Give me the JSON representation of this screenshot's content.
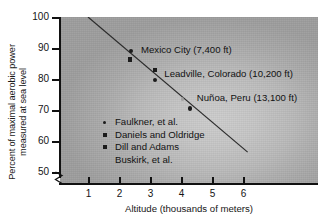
{
  "chart_data": {
    "type": "scatter",
    "title": "",
    "xlabel": "Altitude (thousands of meters)",
    "ylabel_line1": "Percent of maximal aerobic power",
    "ylabel_line2": "measured at sea level",
    "xlim": [
      0.3,
      6.95
    ],
    "ylim": [
      47.5,
      101
    ],
    "xticks": [
      1,
      2,
      3,
      4,
      5,
      6
    ],
    "yticks": [
      50,
      60,
      70,
      80,
      90,
      100
    ],
    "xtick_labels": [
      "1",
      "2",
      "3",
      "4",
      "5",
      "6"
    ],
    "ytick_labels": [
      "50",
      "60",
      "70",
      "80",
      "90",
      "100"
    ],
    "grid": false,
    "y_axis_break": true,
    "legend_position": "inside-lower-left",
    "series": [
      {
        "name": "Faulkner, et al.",
        "marker": "circle",
        "points": [
          {
            "x": 2.4,
            "y": 89.0
          },
          {
            "x": 3.15,
            "y": 79.8
          },
          {
            "x": 4.3,
            "y": 70.5
          }
        ]
      },
      {
        "name": "Daniels and Oldridge",
        "marker": "square",
        "points": [
          {
            "x": 2.35,
            "y": 86.3
          }
        ]
      },
      {
        "name": "Dill and Adams",
        "marker": "square",
        "points": [
          {
            "x": 3.15,
            "y": 83.0
          }
        ]
      },
      {
        "name": "Buskirk, et al.",
        "marker": "none",
        "points": [
          {
            "x": 4.05,
            "y": 73.5
          }
        ]
      }
    ],
    "trendline": {
      "x_start": 1.0,
      "y_start": 100.0,
      "x_end": 6.15,
      "y_end": 56.4
    },
    "annotations": [
      {
        "text": "Mexico City (7,400 ft)",
        "x": 2.55,
        "y": 89.5
      },
      {
        "text": "Leadville, Colorado (10,200 ft)",
        "x": 3.3,
        "y": 81.5
      },
      {
        "text": "Nuñoa, Peru (13,100 ft)",
        "x": 4.35,
        "y": 74.0
      }
    ]
  },
  "legend": {
    "items": [
      {
        "label": "Faulkner, et al.",
        "marker": "circle"
      },
      {
        "label": "Daniels and Oldridge",
        "marker": "square"
      },
      {
        "label": "Dill and Adams",
        "marker": "square"
      },
      {
        "label": "Buskirk, et al.",
        "marker": "none"
      }
    ]
  },
  "colors": {
    "ink": "#121212",
    "marker": "#1b1b1b",
    "plot_bg_center": "#cdcdcd",
    "plot_bg_edge": "#9e9e9e",
    "page_bg": "#ffffff"
  }
}
